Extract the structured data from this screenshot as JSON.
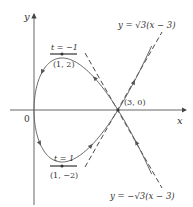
{
  "figure": {
    "type": "parametric-curve",
    "curve": {
      "x_of_t": "t^2",
      "y_of_t": "t^3 - 3t",
      "t_range": [
        -2.05,
        2.05
      ]
    },
    "axes": {
      "x_label": "x",
      "y_label": "y",
      "origin_label": "0"
    },
    "points": [
      {
        "label": "(1, 2)",
        "param_label": "t = −1",
        "x": 1,
        "y": 2
      },
      {
        "label": "(1, −2)",
        "param_label": "t = 1",
        "x": 1,
        "y": -2
      },
      {
        "label": "(3, 0)",
        "x": 3,
        "y": 0
      }
    ],
    "tangent_lines": [
      {
        "label": "y = −√3(x − 3)",
        "slope_sign": -1
      },
      {
        "label": "y = √3(x − 3)",
        "slope_sign": 1
      }
    ],
    "labels": {
      "top_tangent": "y = √3(x − 3)",
      "bottom_tangent": "y = −√3(x − 3)",
      "top_point": "(1, 2)",
      "top_param": "t = −1",
      "bottom_point": "(1, −2)",
      "bottom_param": "t = 1",
      "crossing_point": "(3, 0)",
      "x_axis": "x",
      "y_axis": "y",
      "origin": "0"
    },
    "colors": {
      "curve": "#666666",
      "axes": "#555555",
      "tangent": "#333333",
      "text": "#333333"
    }
  }
}
